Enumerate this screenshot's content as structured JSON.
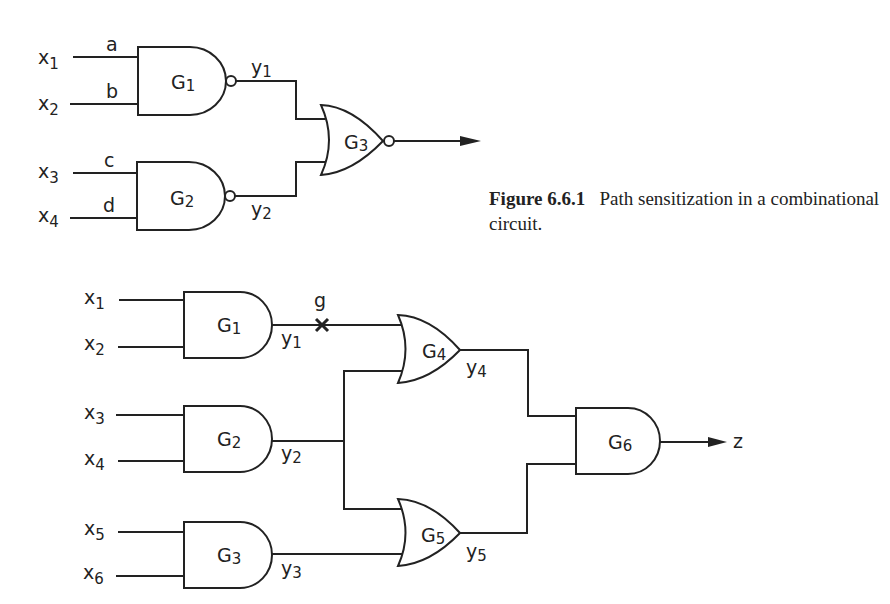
{
  "figure": {
    "number": "Figure 6.6.1",
    "caption": "Path sensitization in a combinational circuit."
  },
  "top_circuit": {
    "inputs": [
      {
        "name": "x",
        "sub": "1",
        "line_label": "a"
      },
      {
        "name": "x",
        "sub": "2",
        "line_label": "b"
      },
      {
        "name": "x",
        "sub": "3",
        "line_label": "c"
      },
      {
        "name": "x",
        "sub": "4",
        "line_label": "d"
      }
    ],
    "gates": [
      {
        "id": "G1",
        "type": "NAND",
        "label": "G",
        "sub": "1",
        "output": {
          "name": "y",
          "sub": "1"
        }
      },
      {
        "id": "G2",
        "type": "NAND",
        "label": "G",
        "sub": "2",
        "output": {
          "name": "y",
          "sub": "2"
        }
      },
      {
        "id": "G3",
        "type": "NOR",
        "label": "G",
        "sub": "3"
      }
    ]
  },
  "bottom_circuit": {
    "inputs": [
      {
        "name": "x",
        "sub": "1"
      },
      {
        "name": "x",
        "sub": "2"
      },
      {
        "name": "x",
        "sub": "3"
      },
      {
        "name": "x",
        "sub": "4"
      },
      {
        "name": "x",
        "sub": "5"
      },
      {
        "name": "x",
        "sub": "6"
      }
    ],
    "gates": [
      {
        "id": "G1",
        "type": "AND",
        "label": "G",
        "sub": "1",
        "output": {
          "name": "y",
          "sub": "1"
        }
      },
      {
        "id": "G2",
        "type": "AND",
        "label": "G",
        "sub": "2",
        "output": {
          "name": "y",
          "sub": "2"
        }
      },
      {
        "id": "G3",
        "type": "AND",
        "label": "G",
        "sub": "3",
        "output": {
          "name": "y",
          "sub": "3"
        }
      },
      {
        "id": "G4",
        "type": "OR",
        "label": "G",
        "sub": "4",
        "output": {
          "name": "y",
          "sub": "4"
        }
      },
      {
        "id": "G5",
        "type": "OR",
        "label": "G",
        "sub": "5",
        "output": {
          "name": "y",
          "sub": "5"
        }
      },
      {
        "id": "G6",
        "type": "AND",
        "label": "G",
        "sub": "6"
      }
    ],
    "fault_marker": {
      "label": "g",
      "symbol": "×"
    },
    "output_label": "z"
  }
}
